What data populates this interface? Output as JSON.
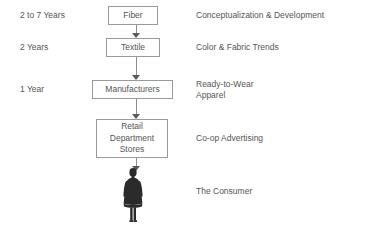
{
  "diagram": {
    "border_color": "#9a9a9a",
    "text_color": "#555555",
    "arrow_color": "#5a5a5a",
    "figure_color": "#2b2b2b",
    "background": "#ffffff"
  },
  "stages": [
    {
      "time": "2 to 7 Years",
      "box": "Fiber",
      "description": "Conceptualization & Development"
    },
    {
      "time": "2 Years",
      "box": "Textile",
      "description": "Color & Fabric Trends"
    },
    {
      "time": "1 Year",
      "box": "Manufacturers",
      "description": "Ready-to-Wear\nApparel"
    },
    {
      "time": "",
      "box": "Retail\nDepartment\nStores",
      "description": "Co-op Advertising"
    },
    {
      "time": "",
      "box": "",
      "description": "The Consumer"
    }
  ],
  "figure": {
    "name": "consumer-silhouette",
    "label": "The Consumer"
  }
}
